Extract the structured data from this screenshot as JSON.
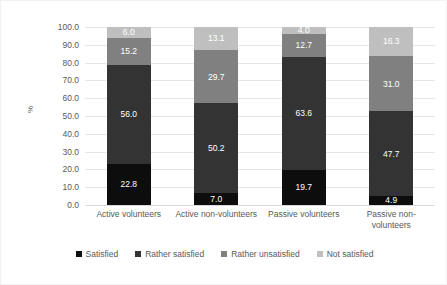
{
  "chart_data": {
    "type": "bar",
    "subtype": "stacked-bar-100",
    "title": "",
    "xlabel": "",
    "ylabel": "%",
    "ylim": [
      0,
      100
    ],
    "ytick_step": 10,
    "ytick_labels": [
      "100.0",
      "90.0",
      "80.0",
      "70.0",
      "60.0",
      "50.0",
      "40.0",
      "30.0",
      "20.0",
      "10.0",
      "0.0"
    ],
    "ytick_values": [
      100,
      90,
      80,
      70,
      60,
      50,
      40,
      30,
      20,
      10,
      0
    ],
    "grid": true,
    "legend_position": "bottom",
    "categories": [
      "Active volunteers",
      "Active non-volunteers",
      "Passive volunteers",
      "Passive non-volunteers"
    ],
    "series": [
      {
        "name": "Satisfied",
        "color": "#0d0d0d",
        "label_color": "light",
        "values": [
          22.8,
          7.0,
          19.7,
          4.9
        ],
        "value_labels": [
          "22.8",
          "7.0",
          "19.7",
          "4.9"
        ]
      },
      {
        "name": "Rather satisfied",
        "color": "#333333",
        "label_color": "light",
        "values": [
          56.0,
          50.2,
          63.6,
          47.7
        ],
        "value_labels": [
          "56.0",
          "50.2",
          "63.6",
          "47.7"
        ]
      },
      {
        "name": "Rather unsatisfied",
        "color": "#808080",
        "label_color": "light",
        "values": [
          15.2,
          29.7,
          12.7,
          31.0
        ],
        "value_labels": [
          "15.2",
          "29.7",
          "12.7",
          "31.0"
        ]
      },
      {
        "name": "Not satisfied",
        "color": "#bfbfbf",
        "label_color": "light",
        "values": [
          6.0,
          13.1,
          4.0,
          16.3
        ],
        "value_labels": [
          "6.0",
          "13.1",
          "4.0",
          "16.3"
        ]
      }
    ]
  },
  "legend": {
    "items": [
      {
        "label": "Satisfied",
        "color": "#0d0d0d"
      },
      {
        "label": "Rather satisfied",
        "color": "#333333"
      },
      {
        "label": "Rather unsatisfied",
        "color": "#808080"
      },
      {
        "label": "Not satisfied",
        "color": "#bfbfbf"
      }
    ]
  }
}
